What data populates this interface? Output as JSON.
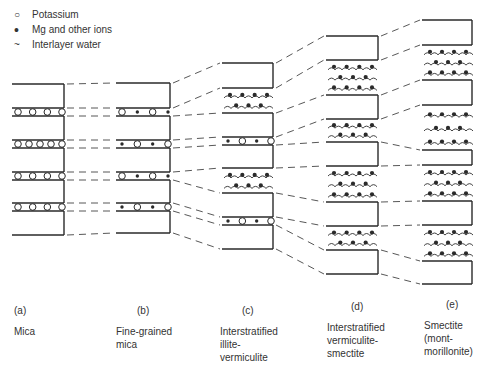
{
  "legend": {
    "items": [
      {
        "symbol": "potassium-open-circle",
        "glyph": "○",
        "label": "Potassium"
      },
      {
        "symbol": "mg-filled-dot",
        "glyph": "•",
        "label": "Mg and other ions"
      },
      {
        "symbol": "water-wave",
        "glyph": "~",
        "label": "Interlayer water"
      }
    ]
  },
  "columns": [
    {
      "id": "a",
      "letter": "(a)",
      "name_lines": [
        "Mica"
      ],
      "x1": 12,
      "x2": 64,
      "label_x": 14,
      "letter_x": 29,
      "stack": [
        {
          "type": "slab",
          "top": 84,
          "bottom": 108
        },
        {
          "type": "K",
          "ions": "OOOO"
        },
        {
          "type": "slab",
          "top": 116,
          "bottom": 140
        },
        {
          "type": "K",
          "ions": "OOOOO"
        },
        {
          "type": "slab",
          "top": 148,
          "bottom": 172
        },
        {
          "type": "K",
          "ions": "OOOO"
        },
        {
          "type": "slab",
          "top": 180,
          "bottom": 203
        },
        {
          "type": "K",
          "ions": "OOOO"
        },
        {
          "type": "slab",
          "top": 211,
          "bottom": 235
        }
      ]
    },
    {
      "id": "b",
      "letter": "(b)",
      "name_lines": [
        "Fine-grained",
        "mica"
      ],
      "x1": 116,
      "x2": 170,
      "label_x": 116,
      "letter_x": 137,
      "stack": [
        {
          "type": "slab",
          "top": 83,
          "bottom": 108
        },
        {
          "type": "K",
          "ions": "O.O."
        },
        {
          "type": "slab",
          "top": 116,
          "bottom": 140
        },
        {
          "type": "K",
          "ions": ".O.O"
        },
        {
          "type": "slab",
          "top": 148,
          "bottom": 172
        },
        {
          "type": "K",
          "ions": "O.O."
        },
        {
          "type": "slab",
          "top": 180,
          "bottom": 203
        },
        {
          "type": "K",
          "ions": ".O.O"
        },
        {
          "type": "slab",
          "top": 211,
          "bottom": 233
        }
      ]
    },
    {
      "id": "c",
      "letter": "(c)",
      "name_lines": [
        "Interstratified",
        "illite-",
        "vermiculite"
      ],
      "x1": 222,
      "x2": 273,
      "label_x": 220,
      "letter_x": 243,
      "stack": [
        {
          "type": "slab",
          "top": 63,
          "bottom": 88
        },
        {
          "type": "W",
          "rows": 2,
          "top": 92
        },
        {
          "type": "slab",
          "top": 113,
          "bottom": 137
        },
        {
          "type": "K",
          "ions": ".O.O"
        },
        {
          "type": "slab",
          "top": 145,
          "bottom": 168
        },
        {
          "type": "W",
          "rows": 2,
          "top": 172
        },
        {
          "type": "slab",
          "top": 193,
          "bottom": 217
        },
        {
          "type": "K",
          "ions": ".O.O"
        },
        {
          "type": "slab",
          "top": 225,
          "bottom": 249
        }
      ]
    },
    {
      "id": "d",
      "letter": "(d)",
      "name_lines": [
        "Interstratified",
        "vermiculite-",
        "smectite"
      ],
      "x1": 326,
      "x2": 378,
      "label_x": 327,
      "letter_x": 351,
      "stack": [
        {
          "type": "slab",
          "top": 36,
          "bottom": 60
        },
        {
          "type": "W",
          "rows": 3,
          "top": 62
        },
        {
          "type": "slab",
          "top": 95,
          "bottom": 119
        },
        {
          "type": "W",
          "rows": 2,
          "top": 122
        },
        {
          "type": "slab",
          "top": 142,
          "bottom": 166
        },
        {
          "type": "W",
          "rows": 3,
          "top": 168
        },
        {
          "type": "slab",
          "top": 202,
          "bottom": 226
        },
        {
          "type": "W",
          "rows": 2,
          "top": 229
        },
        {
          "type": "slab",
          "top": 250,
          "bottom": 274
        }
      ]
    },
    {
      "id": "e",
      "letter": "(e)",
      "name_lines": [
        "Smectite",
        "(mont-",
        "morillonite)"
      ],
      "x1": 422,
      "x2": 472,
      "label_x": 424,
      "letter_x": 446,
      "stack": [
        {
          "type": "slab",
          "top": 20,
          "bottom": 45
        },
        {
          "type": "W",
          "rows": 3,
          "top": 47
        },
        {
          "type": "slab",
          "top": 80,
          "bottom": 105
        },
        {
          "type": "W",
          "rows": 3,
          "top": 107
        },
        {
          "type": "slab",
          "top": 150,
          "bottom": 165
        },
        {
          "type": "W",
          "rows": 3,
          "top": 167
        },
        {
          "type": "slab",
          "top": 201,
          "bottom": 225
        },
        {
          "type": "W",
          "rows": 3,
          "top": 227
        },
        {
          "type": "slab",
          "top": 261,
          "bottom": 284
        }
      ]
    }
  ],
  "labels_top": 304
}
